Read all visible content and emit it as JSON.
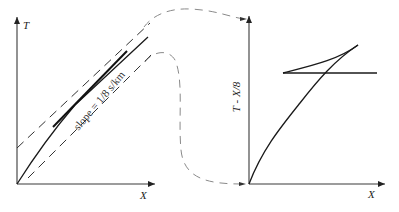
{
  "left_panel": {
    "y_axis_label": "T",
    "x_axis_label": "X",
    "slope_annotation": "slope = 1/8 s/km"
  },
  "right_panel": {
    "y_axis_label": "T - X/8",
    "x_axis_label": "X"
  },
  "colors": {
    "axis": "#3a3a3a",
    "curve": "#1a1a1a",
    "dashed": "#333333",
    "connector": "#8a8a8a"
  }
}
